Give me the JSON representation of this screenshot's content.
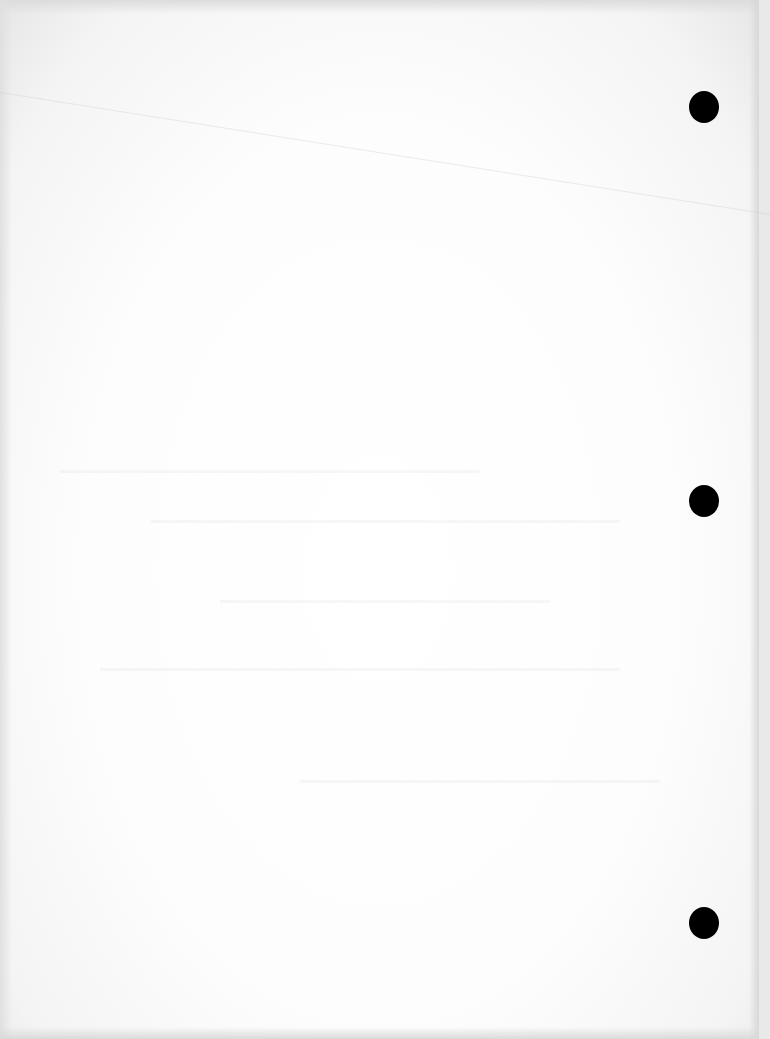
{
  "document": {
    "type": "blank scanned page",
    "text": "",
    "background_color": "#ffffff",
    "punch_holes": [
      {
        "name": "top",
        "x": 704,
        "y": 107,
        "diameter": 30,
        "color": "#000000"
      },
      {
        "name": "middle",
        "x": 704,
        "y": 501,
        "diameter": 30,
        "color": "#000000"
      },
      {
        "name": "bottom",
        "x": 704,
        "y": 923,
        "diameter": 30,
        "color": "#000000"
      }
    ]
  }
}
